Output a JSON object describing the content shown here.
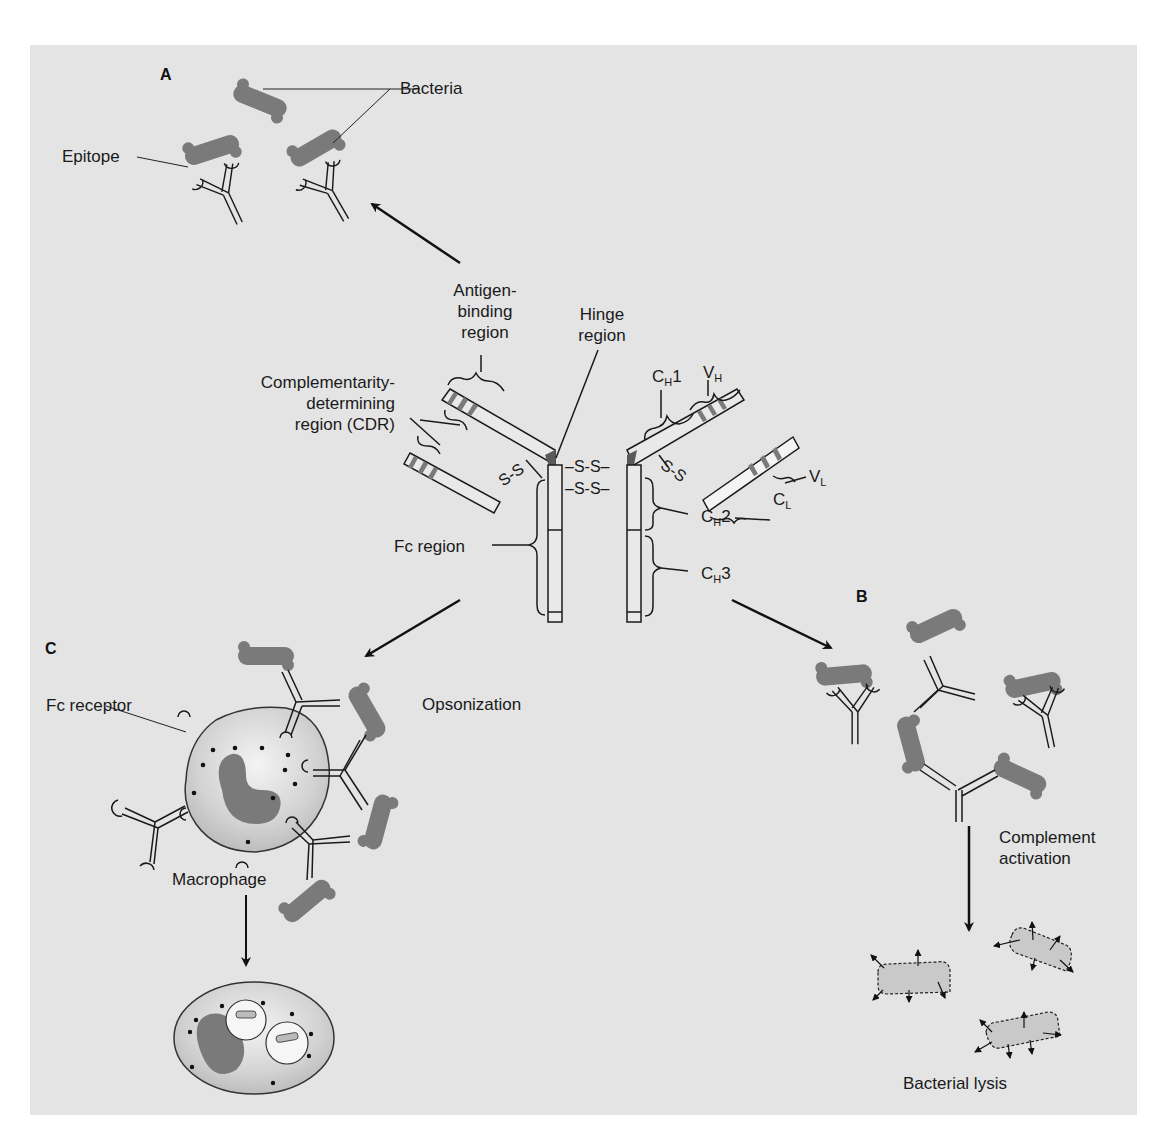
{
  "figure": {
    "background_color": "#e4e4e4",
    "bacteria_color": "#7a7a7a",
    "hinge_color": "#5a5a5a",
    "panels": {
      "A": {
        "letter": "A",
        "labels": {
          "bacteria": "Bacteria",
          "epitope": "Epitope"
        }
      },
      "B": {
        "letter": "B",
        "labels": {
          "complement_line1": "Complement",
          "complement_line2": "activation",
          "lysis": "Bacterial lysis"
        }
      },
      "C": {
        "letter": "C",
        "labels": {
          "fc_receptor": "Fc receptor",
          "opsonization": "Opsonization",
          "macrophage": "Macrophage"
        }
      }
    },
    "antibody": {
      "antigen_binding": [
        "Antigen-",
        "binding",
        "region"
      ],
      "hinge": [
        "Hinge",
        "region"
      ],
      "cdr": [
        "Complementarity-",
        "determining",
        "region (CDR)"
      ],
      "fc_region": "Fc region",
      "disulfide": "S-S",
      "disulfide_center": "–S-S–",
      "domains": {
        "ch1": {
          "main": "C",
          "sub": "H",
          "suffix": "1"
        },
        "vh": {
          "main": "V",
          "sub": "H",
          "suffix": ""
        },
        "vl": {
          "main": "V",
          "sub": "L",
          "suffix": ""
        },
        "cl": {
          "main": "C",
          "sub": "L",
          "suffix": ""
        },
        "ch2": {
          "main": "C",
          "sub": "H",
          "suffix": "2"
        },
        "ch3": {
          "main": "C",
          "sub": "H",
          "suffix": "3"
        }
      }
    }
  }
}
